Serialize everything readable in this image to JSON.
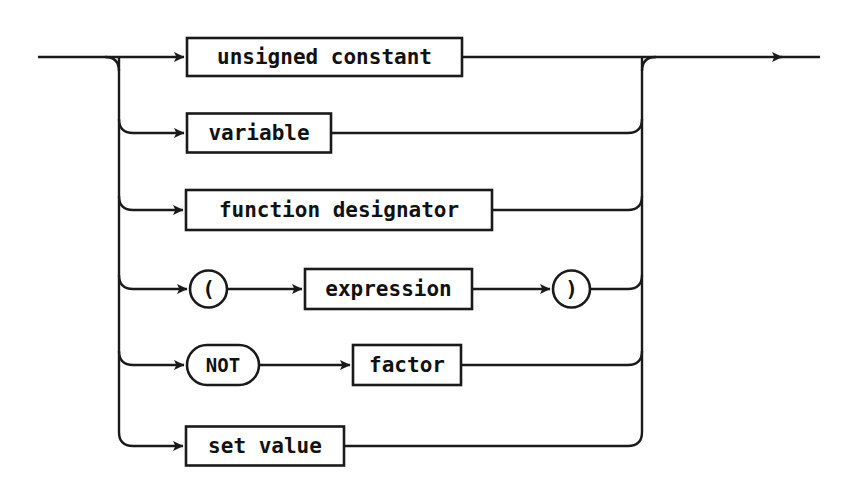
{
  "diagram": {
    "kind": "railroad-syntax-diagram",
    "title": "factor",
    "background_color": "#ffffff",
    "line_color": "#1a1a1a",
    "text_color": "#111111",
    "entry": {
      "name": "entry-rail",
      "x1": 38,
      "x2": 187,
      "y": 57
    },
    "exit": {
      "name": "exit-rail",
      "x1": 642,
      "x2": 820,
      "y": 57,
      "arrow_x": 782
    },
    "left_rail": {
      "x": 119,
      "y_top": 57,
      "y_bottom": 446
    },
    "right_rail": {
      "x": 642,
      "y_top": 57,
      "y_bottom": 446
    },
    "corner_radius": 14,
    "alternatives": [
      {
        "id": "unsigned-constant",
        "y": 57,
        "nodes": [
          {
            "type": "box",
            "label": "unsigned constant",
            "x": 187,
            "w": 275,
            "h": 38,
            "font_size": 21
          }
        ]
      },
      {
        "id": "variable",
        "y": 133,
        "nodes": [
          {
            "type": "box",
            "label": "variable",
            "x": 187,
            "w": 144,
            "h": 39,
            "font_size": 21
          }
        ]
      },
      {
        "id": "function-designator",
        "y": 210,
        "nodes": [
          {
            "type": "box",
            "label": "function designator",
            "x": 186,
            "w": 306,
            "h": 40,
            "font_size": 21
          }
        ]
      },
      {
        "id": "parenthesized-expression",
        "y": 289,
        "nodes": [
          {
            "type": "round",
            "label": "(",
            "x": 190,
            "w": 37,
            "h": 37,
            "font_size": 21
          },
          {
            "type": "box",
            "label": "expression",
            "x": 305,
            "w": 167,
            "h": 40,
            "font_size": 21
          },
          {
            "type": "round",
            "label": ")",
            "x": 553,
            "w": 37,
            "h": 37,
            "font_size": 21
          }
        ]
      },
      {
        "id": "not-factor",
        "y": 365,
        "nodes": [
          {
            "type": "round",
            "label": "NOT",
            "x": 187,
            "w": 72,
            "h": 40,
            "font_size": 19
          },
          {
            "type": "box",
            "label": "factor",
            "x": 353,
            "w": 108,
            "h": 40,
            "font_size": 21
          }
        ]
      },
      {
        "id": "set-value",
        "y": 446,
        "nodes": [
          {
            "type": "box",
            "label": "set value",
            "x": 186,
            "w": 158,
            "h": 39,
            "font_size": 21
          }
        ]
      }
    ]
  }
}
